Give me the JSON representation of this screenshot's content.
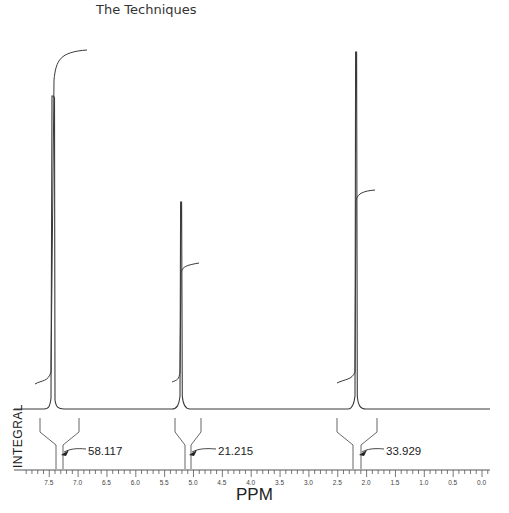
{
  "header": {
    "title": "The Techniques"
  },
  "chart_data": {
    "type": "line",
    "xlabel": "PPM",
    "ylabel": "INTEGRAL",
    "xlim": [
      7.9,
      -0.1
    ],
    "x_reversed": true,
    "x_ticks": [
      "7.5",
      "7.0",
      "6.5",
      "6.0",
      "5.5",
      "5.0",
      "4.5",
      "4.0",
      "3.5",
      "3.0",
      "2.5",
      "2.0",
      "1.5",
      "1.0",
      "0.5",
      "0.0"
    ],
    "grid": false,
    "peaks": [
      {
        "ppm": 7.27,
        "relative_height": 0.88,
        "integral": "58.117"
      },
      {
        "ppm": 5.08,
        "relative_height": 0.58,
        "integral": "21.215"
      },
      {
        "ppm": 2.06,
        "relative_height": 1.0,
        "integral": "33.929"
      }
    ],
    "integrals": [
      "58.117",
      "21.215",
      "33.929"
    ]
  },
  "colors": {
    "trace": "#3a3a3a",
    "axis": "#555555",
    "background": "#ffffff"
  }
}
